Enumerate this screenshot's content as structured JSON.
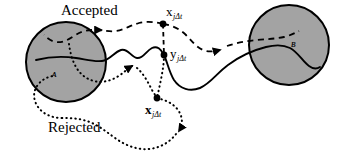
{
  "figure": {
    "title_absent": true,
    "type": "markov-chain-transition-diagram",
    "background_color": "#ffffff",
    "stroke_color": "#000000",
    "region_fill_color": "#a3a3a3",
    "labels": {
      "accepted": "Accepted",
      "rejected": "Rejected",
      "region_a": "ᴀ",
      "region_b": "ʙ"
    },
    "regions": [
      {
        "name": "region-a",
        "label": "ᴀ",
        "cx": 66,
        "cy": 62,
        "r": 40,
        "fill": "#a3a3a3"
      },
      {
        "name": "region-b",
        "label": "ʙ",
        "cx": 289,
        "cy": 45,
        "r": 40,
        "fill": "#a3a3a3"
      }
    ],
    "points": [
      {
        "name": "point-x-top",
        "base": "x",
        "subscript": "jΔt",
        "x": 163,
        "y": 24,
        "label_x": 166,
        "label_y": 7
      },
      {
        "name": "point-y-middle",
        "base": "y",
        "subscript": "jΔt",
        "x": 164,
        "y": 55,
        "label_x": 170,
        "label_y": 48
      },
      {
        "name": "point-x-bottom",
        "base": "x",
        "subscript": "jΔt",
        "x": 157,
        "y": 98,
        "label_x": 146,
        "label_y": 104
      }
    ],
    "annotations": [
      {
        "name": "accepted-label",
        "text": "Accepted",
        "x": 61,
        "y": 4
      },
      {
        "name": "rejected-label",
        "text": "Rejected",
        "x": 48,
        "y": 122
      }
    ],
    "paths": [
      {
        "name": "solid-trajectory",
        "style": "solid",
        "description": "continuous trajectory from region A through y to region B"
      },
      {
        "name": "accepted-trajectory",
        "style": "dashed",
        "description": "accepted move from x back into region A and forward into region B"
      },
      {
        "name": "rejected-trajectory",
        "style": "dotted",
        "description": "rejected move looping from region A through x and back"
      },
      {
        "name": "connector-x-to-y",
        "style": "dashed",
        "description": "vertical connector from x-top to y"
      },
      {
        "name": "connector-y-to-x",
        "style": "dotted",
        "description": "vertical connector from y to x-bottom"
      }
    ]
  }
}
